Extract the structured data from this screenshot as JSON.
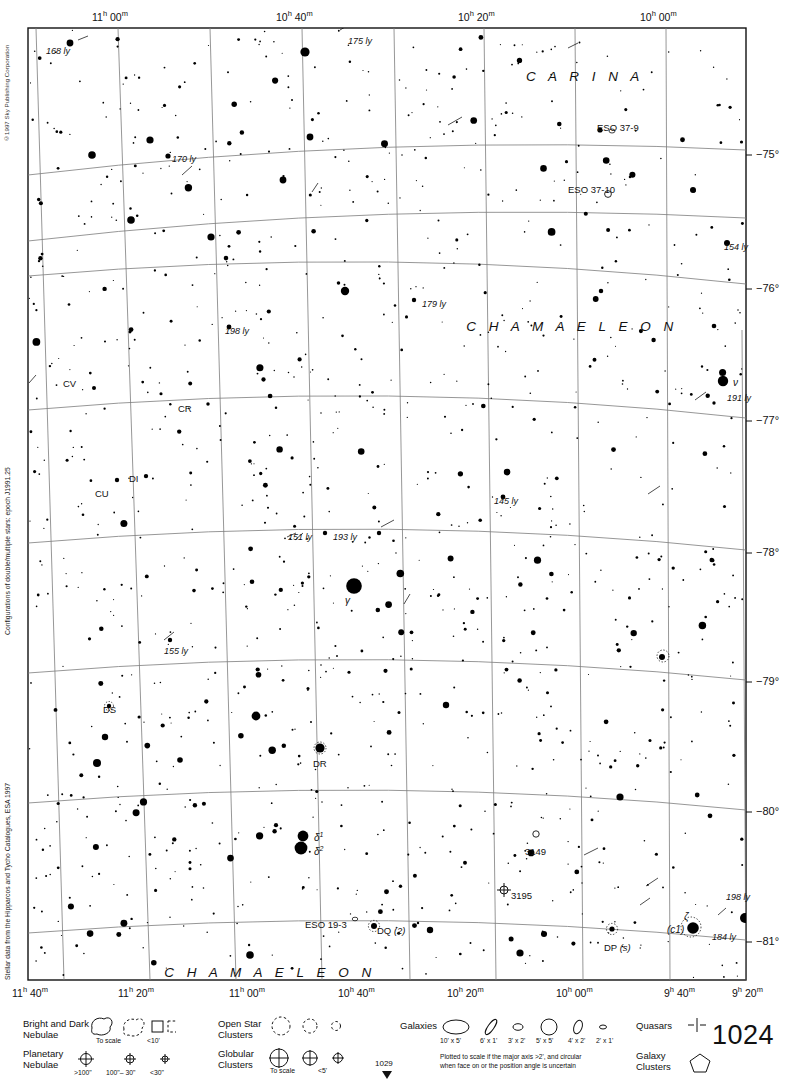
{
  "meta": {
    "chart_number": "1024",
    "copyright": "©1997 Sky Publishing Corporation",
    "side_note_top": "Configurations of double/multiple stars: epoch J1991.25",
    "side_note_bottom": "Stellar data from the Hipparcos and Tycho Catalogues, ESA 1997",
    "adjacent_chart": "1029"
  },
  "chart_data": {
    "type": "scatter",
    "xlabel": "Right Ascension",
    "ylabel": "Declination",
    "xlim": [
      "11h 50m",
      "9h 10m"
    ],
    "ylim": [
      -81.5,
      -74.3
    ],
    "grid": true,
    "ra_ticks_top": [
      {
        "label": "11h 00m",
        "x": 118
      },
      {
        "label": "10h 40m",
        "x": 302
      },
      {
        "label": "10h 20m",
        "x": 484
      },
      {
        "label": "10h 00m",
        "x": 666
      }
    ],
    "ra_ticks_bottom": [
      {
        "label": "11h 40m",
        "x": 36
      },
      {
        "label": "11h 20m",
        "x": 142
      },
      {
        "label": "11h 00m",
        "x": 253
      },
      {
        "label": "10h 40m",
        "x": 362
      },
      {
        "label": "10h 20m",
        "x": 471
      },
      {
        "label": "10h 00m",
        "x": 580
      },
      {
        "label": "9h 40m",
        "x": 688
      },
      {
        "label": "9h 20m",
        "x": 756
      }
    ],
    "dec_ticks": [
      {
        "label": "−75°",
        "y": 155
      },
      {
        "label": "−76°",
        "y": 289
      },
      {
        "label": "−77°",
        "y": 421
      },
      {
        "label": "−78°",
        "y": 553
      },
      {
        "label": "−79°",
        "y": 682
      },
      {
        "label": "−80°",
        "y": 812
      },
      {
        "label": "−81°",
        "y": 942
      }
    ],
    "constellations": [
      {
        "name": "C A R I N A",
        "x": 585,
        "y": 70
      },
      {
        "name": "C H A M A E L E O N",
        "x": 572,
        "y": 320
      },
      {
        "name": "C H A M A E L E O N",
        "x": 270,
        "y": 966
      }
    ],
    "distance_labels": [
      {
        "text": "168 ly",
        "x": 46,
        "y": 47
      },
      {
        "text": "175 ly",
        "x": 348,
        "y": 37
      },
      {
        "text": "170 ly",
        "x": 172,
        "y": 155
      },
      {
        "text": "154 ly",
        "x": 724,
        "y": 243
      },
      {
        "text": "179 ly",
        "x": 422,
        "y": 300
      },
      {
        "text": "198 ly",
        "x": 225,
        "y": 327
      },
      {
        "text": "191 ly",
        "x": 727,
        "y": 394
      },
      {
        "text": "145 ly",
        "x": 494,
        "y": 497
      },
      {
        "text": "151 ly",
        "x": 288,
        "y": 533
      },
      {
        "text": "193 ly",
        "x": 333,
        "y": 533
      },
      {
        "text": "155 ly",
        "x": 164,
        "y": 647
      },
      {
        "text": "198 ly",
        "x": 726,
        "y": 893
      },
      {
        "text": "184 ly",
        "x": 712,
        "y": 933
      }
    ],
    "variable_stars": [
      {
        "name": "CV",
        "x": 63,
        "y": 379
      },
      {
        "name": "CR",
        "x": 178,
        "y": 404
      },
      {
        "name": "DI",
        "x": 129,
        "y": 474
      },
      {
        "name": "CU",
        "x": 95,
        "y": 489
      },
      {
        "name": "DS",
        "x": 103,
        "y": 705
      },
      {
        "name": "DR",
        "x": 313,
        "y": 759
      },
      {
        "name": "DQ (2)",
        "x": 377,
        "y": 926
      },
      {
        "name": "DP (s)",
        "x": 604,
        "y": 943
      }
    ],
    "bayer_stars": [
      {
        "name": "ν",
        "x": 733,
        "y": 378
      },
      {
        "name": "γ",
        "x": 345,
        "y": 596
      },
      {
        "name": "δ¹",
        "x": 314,
        "y": 831
      },
      {
        "name": "δ²",
        "x": 314,
        "y": 845
      },
      {
        "name": "ζ",
        "x": 684,
        "y": 912
      },
      {
        "name": "(c1)",
        "x": 667,
        "y": 925
      }
    ],
    "deep_sky_objects": [
      {
        "name": "ESO 37-9",
        "type": "galaxy",
        "x": 597,
        "y": 123
      },
      {
        "name": "ESO 37-10",
        "type": "galaxy",
        "x": 568,
        "y": 185
      },
      {
        "name": "3149",
        "type": "galaxy",
        "x": 525,
        "y": 847
      },
      {
        "name": "3195",
        "type": "planetary-nebula",
        "x": 511,
        "y": 891
      },
      {
        "name": "ESO 19-3",
        "type": "galaxy",
        "x": 305,
        "y": 920
      }
    ]
  },
  "legend": {
    "nebulae": {
      "bright_dark_label": "Bright and Dark\nNebulae",
      "bright_dark_line1": "Bright and Dark",
      "bright_dark_line2": "Nebulae",
      "to_scale": "To scale",
      "lt10": "<10'",
      "planetary_line1": "Planetary",
      "planetary_line2": "Nebulae",
      "gt100": ">100\"",
      "mid100_30": "100\"– 30\"",
      "lt30": "<30\""
    },
    "clusters": {
      "open_line1": "Open Star",
      "open_line2": "Clusters",
      "globular_line1": "Globular",
      "globular_line2": "Clusters",
      "to_scale": "To scale",
      "lt5": "<5'"
    },
    "galaxies": {
      "title": "Galaxies",
      "sizes": [
        "10' x 5'",
        "6' x 1'",
        "3' x 2'",
        "5' x 5'",
        "4' x 2'",
        "2' x 1'"
      ],
      "note_line1": "Plotted to scale if the major axis >2', and circular",
      "note_line2": "when face on or the position angle is uncertain"
    },
    "quasars": {
      "title": "Quasars"
    },
    "galaxy_clusters": {
      "line1": "Galaxy",
      "line2": "Clusters"
    }
  }
}
